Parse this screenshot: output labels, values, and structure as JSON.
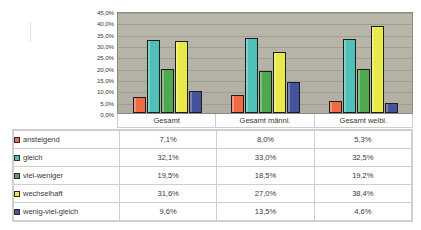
{
  "chart_data": {
    "type": "bar",
    "title": "",
    "subtitle": "",
    "xlabel": "",
    "ylabel": "",
    "ylim": [
      0,
      45
    ],
    "grid": true,
    "legend_position": "bottom-table",
    "categories": [
      "Gesamt",
      "Gesamt männl.",
      "Gesamt weibl."
    ],
    "y_ticks": [
      "0,0%",
      "5,0%",
      "10,0%",
      "15,0%",
      "20,0%",
      "25,0%",
      "30,0%",
      "35,0%",
      "40,0%",
      "45,0%"
    ],
    "y_tick_values": [
      0,
      5,
      10,
      15,
      20,
      25,
      30,
      35,
      40,
      45
    ],
    "series": [
      {
        "name": "ansteigend",
        "color": "#EF6A45",
        "values": [
          7.1,
          8.0,
          5.3
        ],
        "labels": [
          "7,1%",
          "8,0%",
          "5,3%"
        ]
      },
      {
        "name": "gleich",
        "color": "#4FBFB7",
        "values": [
          32.1,
          33.0,
          32.5
        ],
        "labels": [
          "32,1%",
          "33,0%",
          "32,5%"
        ]
      },
      {
        "name": "viel-weniger",
        "color": "#4FA84F",
        "values": [
          19.5,
          18.5,
          19.2
        ],
        "labels": [
          "19,5%",
          "18,5%",
          "19,2%"
        ]
      },
      {
        "name": "wechselhaft",
        "color": "#E9E94B",
        "values": [
          31.6,
          27.0,
          38.4
        ],
        "labels": [
          "31,6%",
          "27,0%",
          "38,4%"
        ]
      },
      {
        "name": "wenig-viel-gleich",
        "color": "#46529B",
        "values": [
          9.6,
          13.5,
          4.6
        ],
        "labels": [
          "9,6%",
          "13,5%",
          "4,6%"
        ]
      }
    ],
    "plot_background": "#b4b3a6"
  },
  "table": {
    "column_headers": [
      "",
      "Gesamt",
      "Gesamt männl.",
      "Gesamt weibl."
    ],
    "rows": [
      {
        "label": "ansteigend",
        "color": "#EF6A45",
        "values": [
          "7,1%",
          "8,0%",
          "5,3%"
        ]
      },
      {
        "label": "gleich",
        "color": "#4FBFB7",
        "values": [
          "32,1%",
          "33,0%",
          "32,5%"
        ]
      },
      {
        "label": "viel-weniger",
        "color": "#4FA84F",
        "values": [
          "19,5%",
          "18,5%",
          "19,2%"
        ]
      },
      {
        "label": "wechselhaft",
        "color": "#E9E94B",
        "values": [
          "31,6%",
          "27,0%",
          "38,4%"
        ]
      },
      {
        "label": "wenig-viel-gleich",
        "color": "#46529B",
        "values": [
          "9,6%",
          "13,5%",
          "4,6%"
        ]
      }
    ]
  }
}
